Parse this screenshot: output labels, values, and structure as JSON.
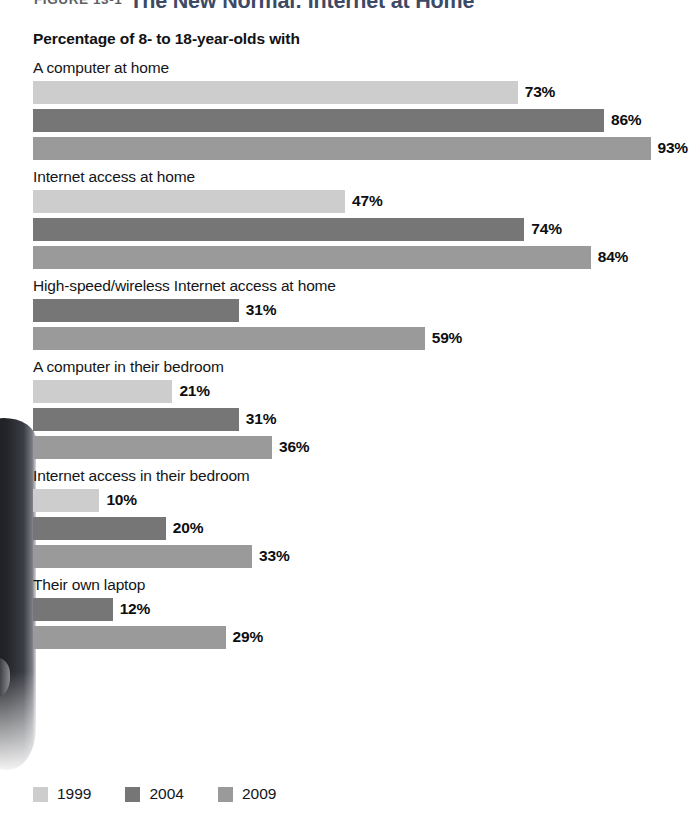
{
  "figure": {
    "number": "FIGURE 13-1",
    "name": "The New Normal: Internet at Home",
    "subtitle": "Percentage of 8- to 18-year-olds with"
  },
  "colors": {
    "y1999": "#cdcdcd",
    "y2004": "#767676",
    "y2009": "#9a9a9a",
    "title_accent": "#3c4a66",
    "text": "#141518"
  },
  "legend": {
    "items": [
      {
        "label": "1999",
        "color": "#cdcdcd"
      },
      {
        "label": "2004",
        "color": "#767676"
      },
      {
        "label": "2009",
        "color": "#9a9a9a"
      }
    ]
  },
  "chart_data": {
    "type": "bar",
    "orientation": "horizontal",
    "title": "The New Normal: Internet at Home",
    "subtitle": "Percentage of 8- to 18-year-olds with",
    "xlabel": "",
    "ylabel": "",
    "xlim": [
      0,
      100
    ],
    "grid": false,
    "legend_position": "bottom-left",
    "value_suffix": "%",
    "categories": [
      "A computer at home",
      "Internet access at home",
      "High-speed/wireless Internet access at home",
      "A computer in their bedroom",
      "Internet access in their bedroom",
      "Their own laptop"
    ],
    "series": [
      {
        "name": "1999",
        "color": "#cdcdcd",
        "values": [
          73,
          47,
          null,
          21,
          10,
          null
        ]
      },
      {
        "name": "2004",
        "color": "#767676",
        "values": [
          86,
          74,
          31,
          31,
          20,
          12
        ]
      },
      {
        "name": "2009",
        "color": "#9a9a9a",
        "values": [
          93,
          84,
          59,
          36,
          33,
          29
        ]
      }
    ],
    "groups": [
      {
        "label": "A computer at home",
        "bars": [
          {
            "series": "1999",
            "value": 73,
            "value_label": "73%",
            "color": "#cdcdcd"
          },
          {
            "series": "2004",
            "value": 86,
            "value_label": "86%",
            "color": "#767676"
          },
          {
            "series": "2009",
            "value": 93,
            "value_label": "93%",
            "color": "#9a9a9a"
          }
        ]
      },
      {
        "label": "Internet access at home",
        "bars": [
          {
            "series": "1999",
            "value": 47,
            "value_label": "47%",
            "color": "#cdcdcd"
          },
          {
            "series": "2004",
            "value": 74,
            "value_label": "74%",
            "color": "#767676"
          },
          {
            "series": "2009",
            "value": 84,
            "value_label": "84%",
            "color": "#9a9a9a"
          }
        ]
      },
      {
        "label": "High-speed/wireless Internet access at home",
        "bars": [
          {
            "series": "2004",
            "value": 31,
            "value_label": "31%",
            "color": "#767676"
          },
          {
            "series": "2009",
            "value": 59,
            "value_label": "59%",
            "color": "#9a9a9a"
          }
        ]
      },
      {
        "label": "A computer in their bedroom",
        "bars": [
          {
            "series": "1999",
            "value": 21,
            "value_label": "21%",
            "color": "#cdcdcd"
          },
          {
            "series": "2004",
            "value": 31,
            "value_label": "31%",
            "color": "#767676"
          },
          {
            "series": "2009",
            "value": 36,
            "value_label": "36%",
            "color": "#9a9a9a"
          }
        ]
      },
      {
        "label": "Internet access in their bedroom",
        "bars": [
          {
            "series": "1999",
            "value": 10,
            "value_label": "10%",
            "color": "#cdcdcd"
          },
          {
            "series": "2004",
            "value": 20,
            "value_label": "20%",
            "color": "#767676"
          },
          {
            "series": "2009",
            "value": 33,
            "value_label": "33%",
            "color": "#9a9a9a"
          }
        ]
      },
      {
        "label": "Their own laptop",
        "bars": [
          {
            "series": "2004",
            "value": 12,
            "value_label": "12%",
            "color": "#767676"
          },
          {
            "series": "2009",
            "value": 29,
            "value_label": "29%",
            "color": "#9a9a9a"
          }
        ]
      }
    ]
  }
}
